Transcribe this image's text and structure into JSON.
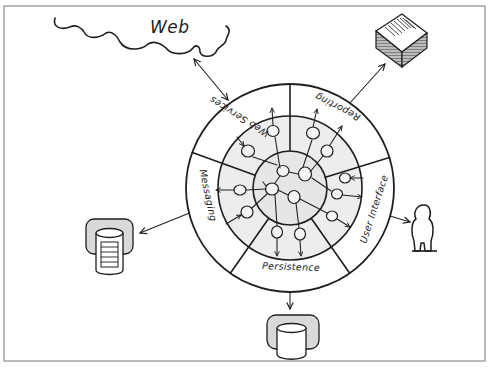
{
  "diagram": {
    "cloud": {
      "label": "Web"
    },
    "segments": [
      {
        "id": "web-services",
        "label": "Web Services"
      },
      {
        "id": "reporting",
        "label": "Reporting"
      },
      {
        "id": "user-interface",
        "label": "User Interface"
      },
      {
        "id": "persistence",
        "label": "Persistence"
      },
      {
        "id": "messaging",
        "label": "Messaging"
      }
    ],
    "external_actors": [
      {
        "id": "web",
        "type": "cloud",
        "label": "Web",
        "connects_to": "web-services",
        "direction": "bidirectional"
      },
      {
        "id": "reports",
        "type": "document-stack",
        "connects_to": "reporting",
        "direction": "outbound"
      },
      {
        "id": "user",
        "type": "person",
        "connects_to": "user-interface",
        "direction": "bidirectional"
      },
      {
        "id": "persistence-db",
        "type": "database",
        "connects_to": "persistence",
        "direction": "outbound"
      },
      {
        "id": "messaging-db",
        "type": "database-queue",
        "connects_to": "messaging",
        "direction": "bidirectional"
      }
    ],
    "rings": [
      "adapters (outer)",
      "application (middle)",
      "domain (inner)"
    ],
    "colors": {
      "ink": "#1e1e1e",
      "ring_fill": "#ededed",
      "core_fill": "#e6e6e6",
      "db_back": "#d9d9d9",
      "frame": "#8c8c8c",
      "background": "#ffffff"
    }
  }
}
